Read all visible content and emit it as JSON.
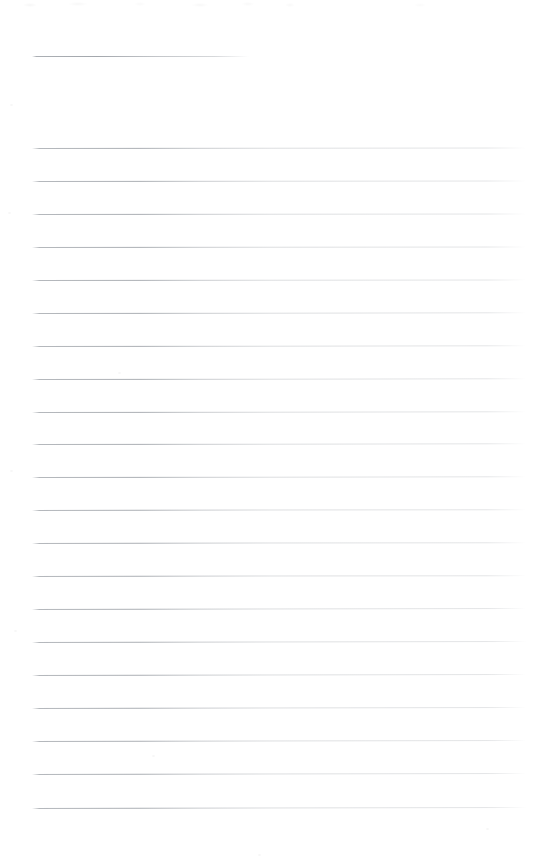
{
  "document": {
    "kind": "scanned-lined-paper",
    "title": "Blank Ruled Notebook Page",
    "content_text": "",
    "page_width": 537,
    "page_height": 866,
    "background_color": "#ffffff",
    "rule_color": "#787e86",
    "is_blank": true
  },
  "ruling": {
    "line_count": 23,
    "left_margin_x": 32,
    "right_edge_x": 525,
    "line_spacing_px": 33,
    "first_line_y": 56,
    "last_line_y": 808,
    "header_gap_px": 92,
    "bottom_margin_px": 58
  },
  "lines": [
    {
      "index": 1,
      "y": 56,
      "x_start": 32,
      "x_end": 249,
      "short": true,
      "text": ""
    },
    {
      "index": 2,
      "y": 148,
      "x_start": 32,
      "x_end": 526,
      "short": false,
      "text": ""
    },
    {
      "index": 3,
      "y": 181,
      "x_start": 32,
      "x_end": 526,
      "short": false,
      "text": ""
    },
    {
      "index": 4,
      "y": 214,
      "x_start": 32,
      "x_end": 526,
      "short": false,
      "text": ""
    },
    {
      "index": 5,
      "y": 247,
      "x_start": 32,
      "x_end": 526,
      "short": false,
      "text": ""
    },
    {
      "index": 6,
      "y": 280,
      "x_start": 32,
      "x_end": 526,
      "short": false,
      "text": ""
    },
    {
      "index": 7,
      "y": 313,
      "x_start": 32,
      "x_end": 526,
      "short": false,
      "text": ""
    },
    {
      "index": 8,
      "y": 346,
      "x_start": 32,
      "x_end": 526,
      "short": false,
      "text": ""
    },
    {
      "index": 9,
      "y": 379,
      "x_start": 32,
      "x_end": 526,
      "short": false,
      "text": ""
    },
    {
      "index": 10,
      "y": 412,
      "x_start": 32,
      "x_end": 526,
      "short": false,
      "text": ""
    },
    {
      "index": 11,
      "y": 444,
      "x_start": 32,
      "x_end": 526,
      "short": false,
      "text": ""
    },
    {
      "index": 12,
      "y": 477,
      "x_start": 32,
      "x_end": 526,
      "short": false,
      "text": ""
    },
    {
      "index": 13,
      "y": 510,
      "x_start": 32,
      "x_end": 526,
      "short": false,
      "text": ""
    },
    {
      "index": 14,
      "y": 543,
      "x_start": 32,
      "x_end": 526,
      "short": false,
      "text": ""
    },
    {
      "index": 15,
      "y": 576,
      "x_start": 32,
      "x_end": 526,
      "short": false,
      "text": ""
    },
    {
      "index": 16,
      "y": 609,
      "x_start": 32,
      "x_end": 526,
      "short": false,
      "text": ""
    },
    {
      "index": 17,
      "y": 642,
      "x_start": 32,
      "x_end": 526,
      "short": false,
      "text": ""
    },
    {
      "index": 18,
      "y": 675,
      "x_start": 32,
      "x_end": 526,
      "short": false,
      "text": ""
    },
    {
      "index": 19,
      "y": 708,
      "x_start": 32,
      "x_end": 526,
      "short": false,
      "text": ""
    },
    {
      "index": 20,
      "y": 741,
      "x_start": 32,
      "x_end": 526,
      "short": false,
      "text": ""
    },
    {
      "index": 21,
      "y": 774,
      "x_start": 32,
      "x_end": 526,
      "short": false,
      "text": ""
    },
    {
      "index": 22,
      "y": 808,
      "x_start": 32,
      "x_end": 526,
      "short": false,
      "text": ""
    }
  ],
  "artifacts": {
    "specks": [
      {
        "x": 10,
        "y": 104,
        "w": 3,
        "h": 2
      },
      {
        "x": 8,
        "y": 212,
        "w": 3,
        "h": 2
      },
      {
        "x": 118,
        "y": 372,
        "w": 3,
        "h": 2
      },
      {
        "x": 10,
        "y": 470,
        "w": 3,
        "h": 2
      },
      {
        "x": 14,
        "y": 630,
        "w": 3,
        "h": 2
      },
      {
        "x": 152,
        "y": 755,
        "w": 3,
        "h": 2
      },
      {
        "x": 486,
        "y": 828,
        "w": 3,
        "h": 2
      },
      {
        "x": 258,
        "y": 854,
        "w": 3,
        "h": 2
      }
    ]
  }
}
